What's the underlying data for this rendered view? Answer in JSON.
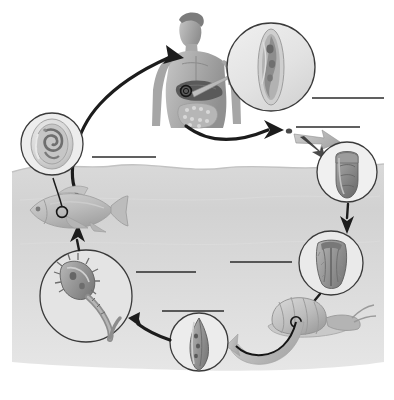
{
  "diagram": {
    "background_color": "#ffffff",
    "water_color": "#d4d4d4",
    "water_top_color": "#e3e3e3",
    "line_color": "#2b2b2b",
    "arrow_color": "#1c1c1c",
    "gray_arrow_color": "#b9b9b9"
  },
  "stages": [
    {
      "id": "definitive-host",
      "name": "human-host",
      "icon_name": "human-torso-figure",
      "description": "Human torso showing liver and intestines with magnification marker",
      "x": 148,
      "y": 12,
      "width": 82,
      "height": 118
    },
    {
      "id": "adult-fluke",
      "name": "adult-fluke-inset",
      "icon_name": "adult-fluke-icon",
      "description": "Magnified elongated adult fluke in liver bile duct",
      "cx": 271,
      "cy": 67,
      "r": 44
    },
    {
      "id": "egg-speck",
      "name": "egg-speck",
      "icon_name": "egg-dot-icon",
      "description": "Tiny egg speck released in feces",
      "cx": 289,
      "cy": 131,
      "r": 3
    },
    {
      "id": "egg",
      "name": "egg-inset",
      "icon_name": "operculated-egg-icon",
      "description": "Magnified operculated egg",
      "cx": 347,
      "cy": 172,
      "r": 30
    },
    {
      "id": "miracidium",
      "name": "miracidium-inset",
      "icon_name": "miracidium-icon",
      "description": "Magnified ciliated miracidium larva",
      "cx": 331,
      "cy": 263,
      "r": 32
    },
    {
      "id": "snail",
      "name": "snail-intermediate-host",
      "icon_name": "snail-icon",
      "description": "Snail intermediate host with magnification marker",
      "x": 272,
      "y": 296,
      "width": 98,
      "height": 44
    },
    {
      "id": "sporocyst",
      "name": "sporocyst-inset",
      "icon_name": "sporocyst-redia-icon",
      "description": "Magnified sporocyst or redia inside snail",
      "cx": 199,
      "cy": 342,
      "r": 29
    },
    {
      "id": "cercaria",
      "name": "cercaria-inset",
      "icon_name": "cercaria-icon",
      "description": "Magnified free-swimming cercaria with forked tail",
      "cx": 86,
      "cy": 296,
      "r": 46
    },
    {
      "id": "fish",
      "name": "fish-second-intermediate-host",
      "icon_name": "fish-icon",
      "description": "Fish second intermediate host with magnification marker",
      "x": 28,
      "y": 190,
      "width": 92,
      "height": 40
    },
    {
      "id": "metacercaria",
      "name": "metacercaria-inset",
      "icon_name": "encysted-metacercaria-icon",
      "description": "Magnified encysted metacercaria in fish muscle",
      "cx": 52,
      "cy": 144,
      "r": 31
    }
  ],
  "label_lines": [
    {
      "id": "label-line-adult",
      "name": "label-line-adult-fluke",
      "text": "",
      "x1": 312,
      "y1": 98,
      "x2": 384,
      "y2": 98
    },
    {
      "id": "label-line-egg",
      "name": "label-line-egg",
      "text": "",
      "x1": 296,
      "y1": 127,
      "x2": 360,
      "y2": 127
    },
    {
      "id": "label-line-human",
      "name": "label-line-human-host",
      "text": "",
      "x1": 92,
      "y1": 157,
      "x2": 156,
      "y2": 157
    },
    {
      "id": "label-line-miracidium",
      "name": "label-line-miracidium",
      "text": "",
      "x1": 230,
      "y1": 262,
      "x2": 292,
      "y2": 262
    },
    {
      "id": "label-line-cercaria",
      "name": "label-line-cercaria",
      "text": "",
      "x1": 136,
      "y1": 272,
      "x2": 196,
      "y2": 272
    },
    {
      "id": "label-line-sporocyst",
      "name": "label-line-sporocyst",
      "text": "",
      "x1": 162,
      "y1": 311,
      "x2": 224,
      "y2": 311
    },
    {
      "id": "label-line-metacercaria",
      "name": "label-line-metacercaria",
      "text": "",
      "x1": 84,
      "y1": 160,
      "x2": 84,
      "y2": 160
    }
  ],
  "arrows": [
    {
      "id": "arrow-fish-to-human",
      "name": "arrow-fish-to-human",
      "style": "black-curve",
      "label": "ingestion of raw fish"
    },
    {
      "id": "arrow-human-to-egg",
      "name": "arrow-human-to-egg",
      "style": "black-curve",
      "label": "eggs passed in feces"
    },
    {
      "id": "arrow-egg-to-mira",
      "name": "arrow-egg-to-miracidium",
      "style": "black-straight",
      "label": "egg hatches"
    },
    {
      "id": "arrow-mira-to-snail",
      "name": "arrow-miracidium-to-snail",
      "style": "black-straight",
      "label": "penetrates snail"
    },
    {
      "id": "arrow-snail-to-cerc",
      "name": "arrow-snail-to-cercaria",
      "style": "gray-curve",
      "label": "cercariae released"
    },
    {
      "id": "arrow-cerc-to-fish",
      "name": "arrow-cercaria-to-fish",
      "style": "black-straight",
      "label": "encysts in fish"
    },
    {
      "id": "arrow-adult-magnify",
      "name": "arrow-adult-magnifier",
      "style": "gray-wedge",
      "label": "magnified view"
    },
    {
      "id": "arrow-egg-magnify",
      "name": "arrow-egg-magnifier",
      "style": "gray-wedge",
      "label": "magnified view"
    }
  ]
}
